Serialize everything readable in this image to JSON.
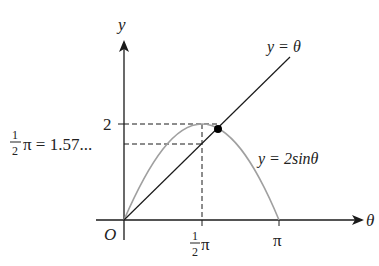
{
  "diagram": {
    "type": "graph",
    "axes": {
      "x_label": "θ",
      "y_label": "y",
      "origin_label": "O"
    },
    "curves": [
      {
        "name": "line",
        "label": "y = θ",
        "color": "#1a1a1a"
      },
      {
        "name": "sine",
        "label": "y = 2sinθ",
        "color": "#a0a0a0"
      }
    ],
    "x_ticks": [
      {
        "num": "1",
        "den": "2",
        "sym": "π",
        "value": 1.5708
      },
      {
        "sym": "π",
        "value": 3.1416
      }
    ],
    "y_ticks": [
      {
        "label": "2",
        "value": 2
      }
    ],
    "annotation": {
      "num": "1",
      "den": "2",
      "text": "π = 1.57..."
    },
    "intersection_point": {
      "color": "#000000"
    }
  }
}
